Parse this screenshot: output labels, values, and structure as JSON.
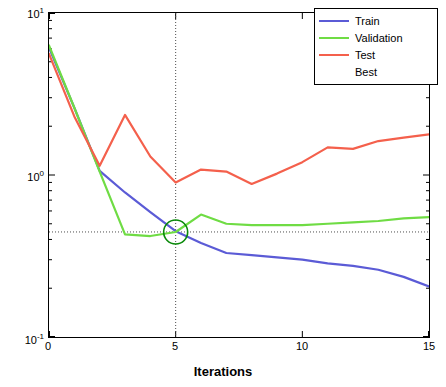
{
  "chart_data": {
    "type": "line",
    "title": "",
    "xlabel": "Iterations",
    "ylabel": "Mean Squared Error",
    "xlim": [
      0,
      15
    ],
    "ylim": [
      0.1,
      10
    ],
    "yscale": "log",
    "xticks": [
      "0",
      "5",
      "10",
      "15"
    ],
    "xtick_values": [
      0,
      5,
      10,
      15
    ],
    "yticks": [
      "10",
      "10",
      "10"
    ],
    "ytick_exponents": [
      "1",
      "0",
      "-1"
    ],
    "ytick_values": [
      10,
      1,
      0.1
    ],
    "grid": false,
    "legend_position": "top-right",
    "x": [
      0,
      1,
      2,
      3,
      4,
      5,
      6,
      7,
      8,
      9,
      10,
      11,
      12,
      13,
      14,
      15
    ],
    "series": [
      {
        "name": "Train",
        "color": "#5b5bd6",
        "values": [
          6.1,
          2.6,
          1.06,
          0.78,
          0.59,
          0.45,
          0.38,
          0.33,
          0.32,
          0.31,
          0.3,
          0.285,
          0.275,
          0.26,
          0.235,
          0.205
        ]
      },
      {
        "name": "Validation",
        "color": "#6fdc44",
        "values": [
          6.3,
          2.6,
          1.05,
          0.43,
          0.42,
          0.445,
          0.57,
          0.5,
          0.49,
          0.49,
          0.49,
          0.5,
          0.51,
          0.52,
          0.54,
          0.55
        ]
      },
      {
        "name": "Test",
        "color": "#f4604c",
        "values": [
          5.6,
          2.3,
          1.14,
          2.35,
          1.3,
          0.9,
          1.08,
          1.05,
          0.88,
          1.02,
          1.2,
          1.48,
          1.45,
          1.62,
          1.7,
          1.78
        ]
      }
    ],
    "best_marker": {
      "label": "Best",
      "color": "#0a8a0a",
      "x": 5,
      "y": 0.445,
      "shape": "circle-outline"
    },
    "crosshair": {
      "x": 5,
      "y": 0.445,
      "style": "dotted",
      "color": "#4d4d4d"
    },
    "legend_entries": [
      {
        "label": "Train",
        "color": "#5b5bd6",
        "has_line": true
      },
      {
        "label": "Validation",
        "color": "#6fdc44",
        "has_line": true
      },
      {
        "label": "Test",
        "color": "#f4604c",
        "has_line": true
      },
      {
        "label": "Best",
        "color": "#0a8a0a",
        "has_line": false
      }
    ]
  }
}
